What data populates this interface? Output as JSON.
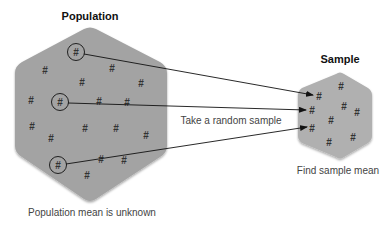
{
  "population": {
    "title": "Population",
    "caption": "Population mean is unknown",
    "fill": "#a3a3a3",
    "symbol": "#",
    "items": [
      {
        "x": 76,
        "y": 52,
        "circled": true
      },
      {
        "x": 45,
        "y": 70
      },
      {
        "x": 112,
        "y": 68
      },
      {
        "x": 82,
        "y": 82
      },
      {
        "x": 141,
        "y": 83
      },
      {
        "x": 31,
        "y": 100
      },
      {
        "x": 60,
        "y": 102,
        "circled": true
      },
      {
        "x": 99,
        "y": 101
      },
      {
        "x": 127,
        "y": 102
      },
      {
        "x": 32,
        "y": 126
      },
      {
        "x": 85,
        "y": 128
      },
      {
        "x": 116,
        "y": 128
      },
      {
        "x": 51,
        "y": 138
      },
      {
        "x": 146,
        "y": 135
      },
      {
        "x": 58,
        "y": 165,
        "circled": true
      },
      {
        "x": 101,
        "y": 159
      },
      {
        "x": 124,
        "y": 160
      },
      {
        "x": 87,
        "y": 175
      }
    ]
  },
  "sample": {
    "title": "Sample",
    "caption": "Find sample mean",
    "fill": "#b0b0b0",
    "symbol": "#",
    "items": [
      {
        "x": 319,
        "y": 96
      },
      {
        "x": 341,
        "y": 86
      },
      {
        "x": 344,
        "y": 106
      },
      {
        "x": 357,
        "y": 112
      },
      {
        "x": 312,
        "y": 110
      },
      {
        "x": 331,
        "y": 120
      },
      {
        "x": 312,
        "y": 128
      },
      {
        "x": 329,
        "y": 142
      },
      {
        "x": 353,
        "y": 137
      }
    ]
  },
  "arrow_label": "Take a random sample",
  "arrows": [
    {
      "x1": 84,
      "y1": 54,
      "x2": 313,
      "y2": 95
    },
    {
      "x1": 68,
      "y1": 103,
      "x2": 306,
      "y2": 110
    },
    {
      "x1": 66,
      "y1": 164,
      "x2": 307,
      "y2": 127
    }
  ]
}
